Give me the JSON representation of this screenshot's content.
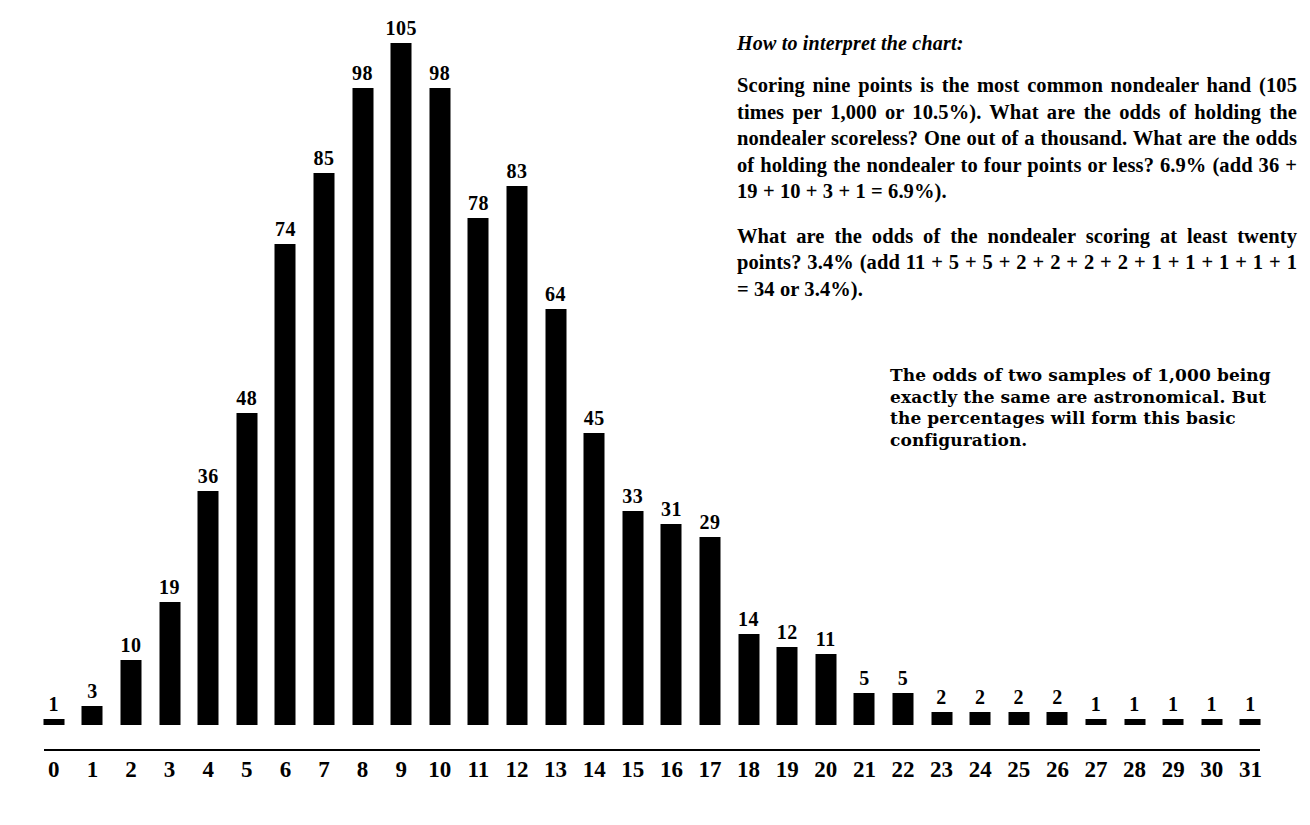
{
  "chart_data": {
    "type": "bar",
    "title": "",
    "subtitle": "",
    "xlabel": "",
    "ylabel": "",
    "ylim": [
      0,
      105
    ],
    "grid": false,
    "legend": "none",
    "orientation": "vertical",
    "bar_color": "#000000",
    "background_color": "#ffffff",
    "value_labels_shown": true,
    "categories": [
      "0",
      "1",
      "2",
      "3",
      "4",
      "5",
      "6",
      "7",
      "8",
      "9",
      "10",
      "11",
      "12",
      "13",
      "14",
      "15",
      "16",
      "17",
      "18",
      "19",
      "20",
      "21",
      "22",
      "23",
      "24",
      "25",
      "26",
      "27",
      "28",
      "29",
      "30",
      "31"
    ],
    "values": [
      1,
      3,
      10,
      19,
      36,
      48,
      74,
      85,
      98,
      105,
      98,
      78,
      83,
      64,
      45,
      33,
      31,
      29,
      14,
      12,
      11,
      5,
      5,
      2,
      2,
      2,
      2,
      1,
      1,
      1,
      1,
      1
    ],
    "total": 1000,
    "peak_category": "9",
    "peak_value": 105
  },
  "notes": {
    "heading": "How to interpret the chart:",
    "paragraph1": "Scoring nine points is the most common nondealer hand (105 times per 1,000 or 10.5%). What are the odds of holding the nondealer scoreless? One out of a thousand. What are the odds of holding the nondealer to four points or less? 6.9% (add 36 + 19 + 10 + 3 + 1 = 6.9%).",
    "paragraph2": "What are the odds of the nondealer scoring at least twenty points? 3.4% (add 11 + 5 + 5 + 2 + 2 + 2 + 2 + 1 + 1 + 1 + 1 + 1 = 34 or 3.4%).",
    "footnote": "The odds of two samples of 1,000 being exactly the same are astronomical.  But the percentages will form this basic configuration."
  }
}
